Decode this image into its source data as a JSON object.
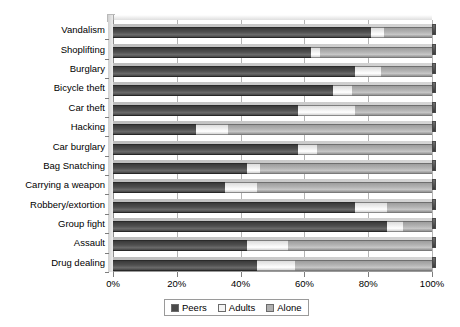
{
  "chart_data": {
    "type": "bar",
    "orientation": "horizontal",
    "stacked": true,
    "title": "",
    "subtitle": "",
    "xlabel": "",
    "ylabel": "",
    "xlim": [
      0,
      100
    ],
    "xticks": [
      0,
      20,
      40,
      60,
      80,
      100
    ],
    "xtick_labels": [
      "0%",
      "20%",
      "40%",
      "60%",
      "80%",
      "100%"
    ],
    "grid": true,
    "legend_position": "bottom",
    "legend_entries": [
      "Peers",
      "Adults",
      "Alone"
    ],
    "colors": {
      "peers": "#4a4a4a",
      "adults": "#f2f2f2",
      "alone": "#b3b3b3",
      "gridline": "#b4b4b4",
      "axis": "#8d8d8d",
      "text": "#000000",
      "background": "#ffffff"
    },
    "categories": [
      "Vandalism",
      "Shoplifting",
      "Burglary",
      "Bicycle theft",
      "Car theft",
      "Hacking",
      "Car burglary",
      "Bag Snatching",
      "Carrying a weapon",
      "Robbery/extortion",
      "Group fight",
      "Assault",
      "Drug dealing"
    ],
    "series": [
      {
        "name": "Peers",
        "values": [
          81,
          62,
          76,
          69,
          58,
          26,
          58,
          42,
          35,
          76,
          86,
          42,
          45
        ]
      },
      {
        "name": "Adults",
        "values": [
          4,
          3,
          8,
          6,
          18,
          10,
          6,
          4,
          10,
          10,
          5,
          13,
          12
        ]
      },
      {
        "name": "Alone",
        "values": [
          15,
          35,
          16,
          25,
          24,
          64,
          36,
          54,
          55,
          14,
          9,
          45,
          43
        ]
      }
    ]
  }
}
